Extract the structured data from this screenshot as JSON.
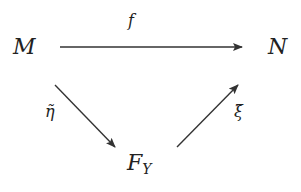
{
  "diagram": {
    "type": "commutative-triangle",
    "nodes": {
      "M": {
        "label": "M"
      },
      "N": {
        "label": "N"
      },
      "F": {
        "label": "F",
        "subscript": "Y"
      }
    },
    "arrows": [
      {
        "from": "M",
        "to": "N",
        "label": "f"
      },
      {
        "from": "M",
        "to": "F_Y",
        "label": "η̃"
      },
      {
        "from": "F_Y",
        "to": "N",
        "label": "ξ̃"
      }
    ],
    "labels": {
      "f": "f",
      "eta": "η̃",
      "xi": "ξ̃"
    },
    "colors": {
      "stroke": "#333333",
      "text": "#222222",
      "background": "#ffffff"
    }
  }
}
